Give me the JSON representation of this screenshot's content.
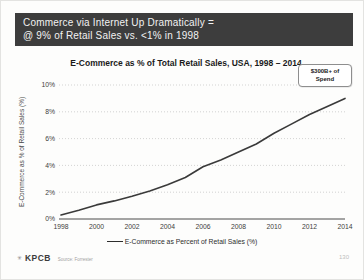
{
  "slide": {
    "header": {
      "line1": "Commerce via Internet Up Dramatically =",
      "line2": "@ 9% of Retail Sales vs. <1% in 1998",
      "bg_color": "#3d3d3d",
      "text_color": "#f2f2f2"
    },
    "footer": {
      "logo_mark": "✳",
      "logo": "KPCB",
      "source": "Source: Forrester",
      "page_number": "130"
    }
  },
  "chart": {
    "title": "E-Commerce as % of Total Retail Sales, USA, 1998 – 2014",
    "y_axis_title": "E-Commerce as % of Retail Sales (%)",
    "legend_label": "E-Commerce as Percent of Retail Sales (%)",
    "callout": {
      "line1": "$300B+ of",
      "line2": "Spend"
    }
  },
  "chart_data": {
    "type": "line",
    "title": "E-Commerce as % of Total Retail Sales, USA, 1998 – 2014",
    "xlabel": "",
    "ylabel": "E-Commerce as % of Retail Sales (%)",
    "x": [
      1998,
      1999,
      2000,
      2001,
      2002,
      2003,
      2004,
      2005,
      2006,
      2007,
      2008,
      2009,
      2010,
      2011,
      2012,
      2013,
      2014
    ],
    "series": [
      {
        "name": "E-Commerce as Percent of Retail Sales (%)",
        "values": [
          0.3,
          0.65,
          1.05,
          1.35,
          1.7,
          2.1,
          2.55,
          3.1,
          3.9,
          4.4,
          5.0,
          5.6,
          6.4,
          7.1,
          7.8,
          8.4,
          9.0
        ]
      }
    ],
    "ylim": [
      0,
      10
    ],
    "y_ticks": [
      0,
      2,
      4,
      6,
      8,
      10
    ],
    "y_tick_labels": [
      "0%",
      "2%",
      "4%",
      "6%",
      "8%",
      "10%"
    ],
    "x_ticks": [
      1998,
      2000,
      2002,
      2004,
      2006,
      2008,
      2010,
      2012,
      2014
    ],
    "grid": "horizontal-dotted",
    "legend_position": "bottom",
    "line_color": "#3a3a3a",
    "annotation": "$300B+ of Spend"
  }
}
